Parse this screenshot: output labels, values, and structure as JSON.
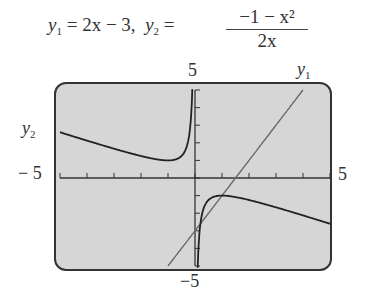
{
  "title": {
    "y1_label": "y",
    "y1_sub": "1",
    "y1_expr": " = 2x − 3,",
    "y2_label": "y",
    "y2_sub": "2",
    "eq": " =",
    "y2_numerator": "−1 − x²",
    "y2_denominator": "2x"
  },
  "labels": {
    "ymax": "5",
    "ymin": "−5",
    "xmin": "− 5",
    "xmax": "5",
    "curve1": "y",
    "curve1_sub": "1",
    "curve2": "y",
    "curve2_sub": "2"
  },
  "chart_data": {
    "type": "line",
    "xlabel": "",
    "ylabel": "",
    "xlim": [
      -5,
      5
    ],
    "ylim": [
      -5,
      5
    ],
    "xticks": [
      -5,
      -4,
      -3,
      -2,
      -1,
      0,
      1,
      2,
      3,
      4,
      5
    ],
    "yticks": [
      -5,
      -4,
      -3,
      -2,
      -1,
      0,
      1,
      2,
      3,
      4,
      5
    ],
    "grid": false,
    "background": "#d6d6d6",
    "series": [
      {
        "name": "y1",
        "expression": "2x - 3",
        "color": "#6a6a6a",
        "x": [
          -1,
          -0.5,
          0,
          0.5,
          1,
          1.5,
          2,
          2.5,
          3,
          3.5,
          4
        ],
        "y": [
          -5,
          -4,
          -3,
          -2,
          -1,
          0,
          1,
          2,
          3,
          4,
          5
        ]
      },
      {
        "name": "y2",
        "expression": "(-1 - x^2)/(2x)",
        "color": "#222222",
        "x": [
          -5,
          -4,
          -3,
          -2,
          -1,
          -0.5,
          -0.2,
          -0.1,
          0.1,
          0.2,
          0.5,
          1,
          2,
          3,
          4,
          5
        ],
        "y": [
          2.6,
          2.125,
          1.667,
          1.25,
          1,
          1.25,
          2.6,
          5.05,
          -5.05,
          -2.6,
          -1.25,
          -1,
          -1.25,
          -1.667,
          -2.125,
          -2.6
        ]
      }
    ]
  }
}
